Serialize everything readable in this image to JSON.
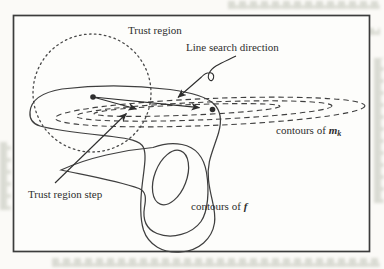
{
  "figure": {
    "kind": "trust-region-vs-line-search-diagram",
    "labels": {
      "trust_region": "Trust region",
      "line_search_direction": "Line search direction",
      "trust_region_step": "Trust region step",
      "contours_of_model": {
        "prefix": "contours of",
        "symbol": "m",
        "subscript": "k"
      },
      "contours_of_objective": {
        "prefix": "contours of",
        "symbol": "f"
      }
    },
    "colors": {
      "ink": "#3a3a3a",
      "paper": "#fbfaf7",
      "border": "#3c3c3c",
      "ghost_text": "#b9bdb0"
    }
  }
}
